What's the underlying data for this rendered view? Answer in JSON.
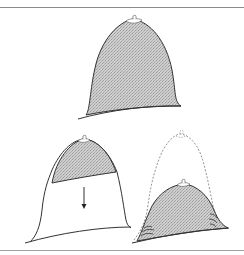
{
  "figure": {
    "type": "anatomical-line-diagram",
    "panels": [
      {
        "id": "top",
        "description": "shaded dome shape with nipple at apex"
      },
      {
        "id": "bottom-left",
        "description": "dome with shaded upper cap and white lower portion, downward arrow"
      },
      {
        "id": "bottom-right",
        "description": "dashed outline of original dome with smaller shaded dome inside, fold marks at base"
      }
    ],
    "colors": {
      "outline": "#333333",
      "shade": "#c8c8c8",
      "dashed": "#777777",
      "rule": "#8a8a8a"
    },
    "arrow": {
      "direction": "down"
    }
  }
}
